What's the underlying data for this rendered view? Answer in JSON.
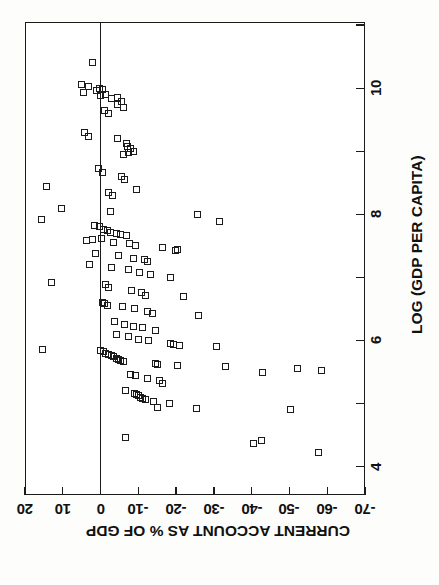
{
  "figure": {
    "background_color": "#ffffff",
    "ink_color": "#1a1a1a",
    "orientation_note": "landscape chart printed rotated 90 degrees on a portrait page"
  },
  "chart_data": {
    "type": "scatter",
    "title": "",
    "xlabel": "LOG (GDP PER CAPITA)",
    "ylabel": "CURRENT ACCOUNT AS % OF GDP",
    "xlim": [
      3.55,
      11.05
    ],
    "ylim": [
      -70,
      20
    ],
    "xticks_major": [
      4,
      6,
      8,
      10
    ],
    "xticks_major_labels": [
      "4",
      "6",
      "8",
      "10"
    ],
    "xticks_minor": [
      5,
      7,
      9,
      11
    ],
    "yticks": [
      20,
      10,
      0,
      -10,
      -20,
      -30,
      -40,
      -50,
      -60,
      -70
    ],
    "ytick_labels": [
      "20",
      "10",
      "0",
      "-10",
      "-20",
      "-30",
      "-40",
      "-50",
      "-60",
      "-70"
    ],
    "grid": false,
    "legend": false,
    "reference_lines": [
      {
        "axis": "y",
        "value": 0,
        "style": "solid"
      }
    ],
    "marker": {
      "shape": "open-square",
      "size_px": 7,
      "fill": "none",
      "edge_color": "#1b1b1b"
    },
    "series": [
      {
        "name": "countries",
        "points": [
          [
            10.4,
            2.2
          ],
          [
            10.06,
            5.0
          ],
          [
            10.03,
            3.2
          ],
          [
            10.0,
            0.3
          ],
          [
            9.98,
            -0.5
          ],
          [
            9.96,
            1.0
          ],
          [
            9.93,
            4.6
          ],
          [
            9.9,
            -1.2
          ],
          [
            9.88,
            0.0
          ],
          [
            9.86,
            -4.6
          ],
          [
            9.84,
            -3.0
          ],
          [
            9.79,
            -5.5
          ],
          [
            9.74,
            -4.4
          ],
          [
            9.7,
            -6.2
          ],
          [
            9.64,
            -1.1
          ],
          [
            9.6,
            -2.0
          ],
          [
            9.3,
            4.3
          ],
          [
            9.24,
            3.3
          ],
          [
            9.2,
            -4.6
          ],
          [
            9.12,
            -6.9
          ],
          [
            9.08,
            -7.2
          ],
          [
            9.04,
            -8.0
          ],
          [
            9.0,
            -8.6
          ],
          [
            8.98,
            -7.3
          ],
          [
            8.95,
            -6.0
          ],
          [
            8.72,
            0.6
          ],
          [
            8.66,
            -0.4
          ],
          [
            8.6,
            -5.5
          ],
          [
            8.56,
            -6.3
          ],
          [
            8.44,
            14.4
          ],
          [
            8.4,
            -9.5
          ],
          [
            8.34,
            -2.0
          ],
          [
            8.3,
            -3.1
          ],
          [
            8.1,
            10.3
          ],
          [
            8.05,
            -2.6
          ],
          [
            8.0,
            -25.6
          ],
          [
            7.92,
            15.6
          ],
          [
            7.88,
            -31.5
          ],
          [
            7.82,
            1.7
          ],
          [
            7.8,
            0.2
          ],
          [
            7.76,
            -0.9
          ],
          [
            7.74,
            -1.8
          ],
          [
            7.72,
            -2.6
          ],
          [
            7.7,
            -4.2
          ],
          [
            7.68,
            -5.2
          ],
          [
            7.66,
            -6.8
          ],
          [
            7.62,
            -0.3
          ],
          [
            7.6,
            2.2
          ],
          [
            7.58,
            3.6
          ],
          [
            7.56,
            -3.3
          ],
          [
            7.54,
            -7.6
          ],
          [
            7.5,
            -9.3
          ],
          [
            7.48,
            -16.5
          ],
          [
            7.44,
            -20.4
          ],
          [
            7.42,
            -19.8
          ],
          [
            7.38,
            1.4
          ],
          [
            7.34,
            -4.8
          ],
          [
            7.3,
            -8.6
          ],
          [
            7.28,
            -11.6
          ],
          [
            7.26,
            -12.5
          ],
          [
            7.2,
            3.0
          ],
          [
            7.16,
            -2.9
          ],
          [
            7.12,
            -7.4
          ],
          [
            7.08,
            -10.2
          ],
          [
            7.04,
            -13.3
          ],
          [
            7.0,
            -18.6
          ],
          [
            6.92,
            13.0
          ],
          [
            6.88,
            -1.2
          ],
          [
            6.84,
            -2.2
          ],
          [
            6.8,
            -8.1
          ],
          [
            6.76,
            -10.8
          ],
          [
            6.72,
            -12.0
          ],
          [
            6.7,
            -22.0
          ],
          [
            6.6,
            -0.6
          ],
          [
            6.58,
            -1.1
          ],
          [
            6.56,
            -1.9
          ],
          [
            6.54,
            -5.8
          ],
          [
            6.5,
            -9.0
          ],
          [
            6.46,
            -12.4
          ],
          [
            6.42,
            -13.7
          ],
          [
            6.4,
            -25.8
          ],
          [
            6.3,
            -3.8
          ],
          [
            6.26,
            -6.3
          ],
          [
            6.22,
            -8.8
          ],
          [
            6.2,
            -11.2
          ],
          [
            6.16,
            -14.5
          ],
          [
            6.1,
            -4.2
          ],
          [
            6.06,
            -7.5
          ],
          [
            6.02,
            -10.0
          ],
          [
            6.0,
            -12.7
          ],
          [
            5.96,
            -18.4
          ],
          [
            5.94,
            -19.4
          ],
          [
            5.92,
            -21.0
          ],
          [
            5.9,
            -30.6
          ],
          [
            5.86,
            15.5
          ],
          [
            5.84,
            0.0
          ],
          [
            5.82,
            -0.7
          ],
          [
            5.8,
            -1.3
          ],
          [
            5.78,
            -2.1
          ],
          [
            5.76,
            -2.8
          ],
          [
            5.74,
            -3.4
          ],
          [
            5.72,
            -4.1
          ],
          [
            5.7,
            -4.8
          ],
          [
            5.68,
            -5.4
          ],
          [
            5.66,
            -6.0
          ],
          [
            5.64,
            -14.6
          ],
          [
            5.62,
            -15.2
          ],
          [
            5.6,
            -20.4
          ],
          [
            5.58,
            -33.2
          ],
          [
            5.56,
            -52.0
          ],
          [
            5.52,
            -58.5
          ],
          [
            5.5,
            -42.8
          ],
          [
            5.46,
            -8.0
          ],
          [
            5.44,
            -9.3
          ],
          [
            5.4,
            -12.5
          ],
          [
            5.36,
            -15.7
          ],
          [
            5.32,
            -16.4
          ],
          [
            5.2,
            -6.6
          ],
          [
            5.16,
            -9.0
          ],
          [
            5.14,
            -9.6
          ],
          [
            5.12,
            -10.1
          ],
          [
            5.1,
            -10.6
          ],
          [
            5.08,
            -11.2
          ],
          [
            5.06,
            -12.0
          ],
          [
            5.04,
            -13.9
          ],
          [
            5.0,
            -18.2
          ],
          [
            4.94,
            -15.0
          ],
          [
            4.92,
            -25.5
          ],
          [
            4.9,
            -50.4
          ],
          [
            4.46,
            -6.5
          ],
          [
            4.42,
            -42.6
          ],
          [
            4.36,
            -40.6
          ],
          [
            4.22,
            -57.8
          ]
        ]
      }
    ]
  },
  "axes": {
    "x_axis": {
      "title": "LOG (GDP PER CAPITA)",
      "labels": [
        "4",
        "6",
        "8",
        "10"
      ]
    },
    "y_axis": {
      "title": "CURRENT ACCOUNT AS % OF GDP",
      "labels": [
        "20",
        "10",
        "0",
        "-10",
        "-20",
        "-30",
        "-40",
        "-50",
        "-60",
        "-70"
      ]
    }
  }
}
